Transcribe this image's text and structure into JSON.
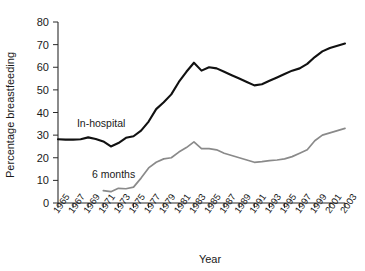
{
  "chart_data": {
    "type": "line",
    "title": "",
    "xlabel": "Year",
    "ylabel": "Percentage breastfeeding",
    "xlim": [
      1965,
      2003
    ],
    "ylim": [
      0,
      80
    ],
    "grid": false,
    "legend_position": "inline-annotation",
    "ytick_labels": [
      "0",
      "10",
      "20",
      "30",
      "40",
      "50",
      "60",
      "70",
      "80"
    ],
    "ytick_values": [
      0,
      10,
      20,
      30,
      40,
      50,
      60,
      70,
      80
    ],
    "xtick_labels": [
      "1965",
      "1967",
      "1969",
      "1971",
      "1973",
      "1975",
      "1977",
      "1979",
      "1981",
      "1983",
      "1985",
      "1987",
      "1989",
      "1991",
      "1993",
      "1995",
      "1997",
      "1999",
      "2001",
      "2003"
    ],
    "xtick_values": [
      1965,
      1967,
      1969,
      1971,
      1973,
      1975,
      1977,
      1979,
      1981,
      1983,
      1985,
      1987,
      1989,
      1991,
      1993,
      1995,
      1997,
      1999,
      2001,
      2003
    ],
    "series": [
      {
        "name": "In-hospital",
        "color": "#111111",
        "x": [
          1965,
          1966,
          1967,
          1968,
          1969,
          1970,
          1971,
          1972,
          1973,
          1974,
          1975,
          1976,
          1977,
          1978,
          1979,
          1980,
          1981,
          1982,
          1983,
          1984,
          1985,
          1986,
          1987,
          1988,
          1989,
          1990,
          1991,
          1992,
          1993,
          1994,
          1995,
          1996,
          1997,
          1998,
          1999,
          2000,
          2001,
          2002,
          2003
        ],
        "y": [
          28.2,
          28.0,
          28.0,
          28.2,
          29.0,
          28.3,
          27.2,
          25.0,
          26.5,
          28.8,
          29.5,
          32.0,
          36.0,
          41.5,
          44.5,
          48.0,
          53.5,
          58.0,
          62.0,
          58.5,
          60.0,
          59.5,
          58.0,
          56.5,
          55.0,
          53.5,
          52.0,
          52.5,
          54.0,
          55.5,
          57.0,
          58.5,
          59.5,
          61.5,
          64.5,
          67.0,
          68.5,
          69.5,
          70.5
        ]
      },
      {
        "name": "6 months",
        "color": "#8a8a8a",
        "x": [
          1971,
          1972,
          1973,
          1974,
          1975,
          1976,
          1977,
          1978,
          1979,
          1980,
          1981,
          1982,
          1983,
          1984,
          1985,
          1986,
          1987,
          1988,
          1989,
          1990,
          1991,
          1992,
          1993,
          1994,
          1995,
          1996,
          1997,
          1998,
          1999,
          2000,
          2001,
          2002,
          2003
        ],
        "y": [
          5.5,
          5.0,
          6.5,
          6.3,
          7.0,
          11.0,
          15.5,
          18.0,
          19.5,
          20.0,
          22.5,
          24.5,
          27.0,
          24.0,
          24.0,
          23.5,
          22.0,
          21.0,
          20.0,
          19.0,
          18.0,
          18.3,
          18.7,
          19.0,
          19.5,
          20.5,
          22.0,
          23.5,
          27.5,
          30.0,
          31.0,
          32.0,
          33.0
        ]
      }
    ],
    "annotations": [
      {
        "text": "In-hospital",
        "x": 1967.5,
        "y": 33.5
      },
      {
        "text": "6 months",
        "x": 1969.5,
        "y": 11.0
      }
    ]
  }
}
